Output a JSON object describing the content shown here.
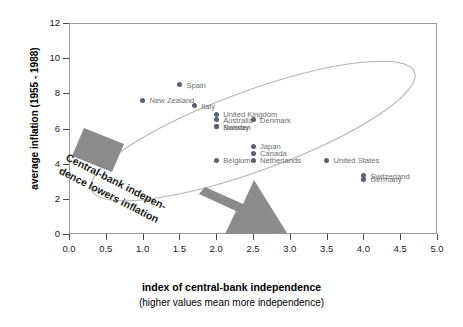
{
  "chart_data": {
    "type": "scatter",
    "title": "",
    "xlabel": "index of central-bank independence",
    "xsublabel": "(higher values mean more independence)",
    "ylabel": "average inflation (1955 - 1988)",
    "xlim": [
      0.0,
      5.0
    ],
    "ylim": [
      0,
      12
    ],
    "xticks": [
      "0.0",
      "0.5",
      "1.0",
      "1.5",
      "2.0",
      "2.5",
      "3.0",
      "3.5",
      "4.0",
      "4.5",
      "5.0"
    ],
    "xtick_values": [
      0.0,
      0.5,
      1.0,
      1.5,
      2.0,
      2.5,
      3.0,
      3.5,
      4.0,
      4.5,
      5.0
    ],
    "yticks": [
      "0",
      "2",
      "4",
      "6",
      "8",
      "10",
      "12"
    ],
    "ytick_values": [
      0,
      2,
      4,
      6,
      8,
      10,
      12
    ],
    "grid": false,
    "legend": false,
    "point_color": "#586270",
    "label_color": "#6c6c6c",
    "points": [
      {
        "label": "Spain",
        "x": 1.5,
        "y": 8.5,
        "lx": 7,
        "ly": -4
      },
      {
        "label": "New Zealand",
        "x": 1.0,
        "y": 7.6,
        "lx": 7,
        "ly": -4
      },
      {
        "label": "Italy",
        "x": 1.7,
        "y": 7.3,
        "lx": 7,
        "ly": -4
      },
      {
        "label": "United Kingdom",
        "x": 2.0,
        "y": 6.8,
        "lx": 7,
        "ly": -4
      },
      {
        "label": "Australia",
        "x": 2.0,
        "y": 6.5,
        "lx": 7,
        "ly": -4
      },
      {
        "label": "Sweden",
        "x": 2.0,
        "y": 6.1,
        "lx": 7,
        "ly": -4
      },
      {
        "label": "Norway",
        "x": 2.0,
        "y": 6.1,
        "lx": 7,
        "ly": -4
      },
      {
        "label": "Denmark",
        "x": 2.5,
        "y": 6.5,
        "lx": 7,
        "ly": -4
      },
      {
        "label": "Japan",
        "x": 2.5,
        "y": 5.0,
        "lx": 7,
        "ly": -4
      },
      {
        "label": "Canada",
        "x": 2.5,
        "y": 4.6,
        "lx": 7,
        "ly": -4
      },
      {
        "label": "Netherlands",
        "x": 2.5,
        "y": 4.2,
        "lx": 7,
        "ly": -4
      },
      {
        "label": "Belgium",
        "x": 2.0,
        "y": 4.2,
        "lx": 7,
        "ly": -4
      },
      {
        "label": "United States",
        "x": 3.5,
        "y": 4.2,
        "lx": 7,
        "ly": -4
      },
      {
        "label": "Switzerland",
        "x": 4.0,
        "y": 3.3,
        "lx": 7,
        "ly": -4
      },
      {
        "label": "Germany",
        "x": 4.0,
        "y": 3.1,
        "lx": 7,
        "ly": -4
      }
    ],
    "annotations": [
      {
        "name": "trend-annotation",
        "text_line1": "Central-bank indepen-",
        "text_line2": "dence lowers inflation"
      },
      {
        "name": "trend-ellipse",
        "shape": "ellipse",
        "color": "#b0b0b0"
      },
      {
        "name": "trend-arrow",
        "shape": "arrow",
        "color": "#8b8b8b"
      }
    ]
  },
  "axes": {
    "y_title": "average inflation (1955 - 1988)",
    "x_title": "index of central-bank independence",
    "x_subtitle": "(higher values mean more independence)"
  }
}
